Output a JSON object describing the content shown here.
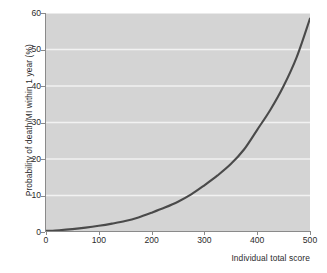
{
  "chart_data": {
    "type": "line",
    "title": "",
    "xlabel": "Individual total score",
    "ylabel": "Probability of death/MI within 1 year (%)",
    "xlim": [
      0,
      500
    ],
    "ylim": [
      0,
      60
    ],
    "xticks": [
      "0",
      "100",
      "200",
      "300",
      "400",
      "500"
    ],
    "xtick_values": [
      0,
      100,
      200,
      300,
      400,
      500
    ],
    "yticks": [
      "0",
      "10",
      "20",
      "30",
      "40",
      "50",
      "60"
    ],
    "ytick_values": [
      0,
      10,
      20,
      30,
      40,
      50,
      60
    ],
    "grid": "horizontal-white-gridlines",
    "legend": "none",
    "panel_background": "#d4d4d4",
    "gridline_color": "#f2f2f2",
    "line_color": "#4a4a4a",
    "line_width_px": 2.1,
    "series": [
      {
        "name": "Probability of death/MI within 1 year",
        "x": [
          0,
          25,
          50,
          75,
          100,
          125,
          150,
          175,
          200,
          225,
          250,
          275,
          300,
          325,
          350,
          375,
          400,
          425,
          450,
          475,
          500
        ],
        "values": [
          0.3,
          0.5,
          0.8,
          1.2,
          1.7,
          2.3,
          3.0,
          4.0,
          5.3,
          6.7,
          8.3,
          10.3,
          12.8,
          15.5,
          18.6,
          22.6,
          28.0,
          33.5,
          40.0,
          48.0,
          58.5
        ]
      }
    ]
  },
  "axes": {
    "y_title": "Probability of death/MI within 1 year (%)",
    "x_title": "Individual total score"
  }
}
